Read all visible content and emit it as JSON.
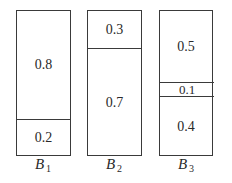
{
  "boxes": [
    {
      "name": "B",
      "sub": "1",
      "segments": [
        {
          "label": "0.8",
          "value": 0.8
        },
        {
          "label": "0.2",
          "value": 0.2
        }
      ]
    },
    {
      "name": "B",
      "sub": "2",
      "segments": [
        {
          "label": "0.3",
          "value": 0.3
        },
        {
          "label": "0.7",
          "value": 0.7
        }
      ]
    },
    {
      "name": "B",
      "sub": "3",
      "segments": [
        {
          "label": "0.5",
          "value": 0.5
        },
        {
          "label": "0.1",
          "value": 0.1
        },
        {
          "label": "0.4",
          "value": 0.4
        }
      ]
    }
  ]
}
